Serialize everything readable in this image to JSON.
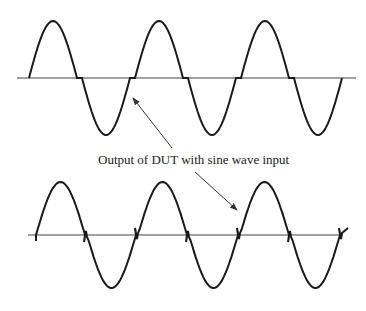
{
  "diagram": {
    "annotation": "Output of DUT with sine wave input",
    "top_waveform": {
      "name": "sine output with crossover dead-zone (flat segments at zero crossing)",
      "axis": {
        "y": 78,
        "x_start": 17,
        "x_end": 356
      },
      "period_px": 106,
      "amplitude_px": 57,
      "dead_zone_px": 5,
      "start_x": 29,
      "cycles": 3
    },
    "bottom_waveform": {
      "name": "sine output with zero-crossing glitches (small spikes at crossings)",
      "axis": {
        "y": 235,
        "x_start": 28,
        "x_end": 343
      },
      "period_px": 98,
      "amplitude_px": 53,
      "start_x": 36,
      "cycles": 3.2
    },
    "colors": {
      "stroke": "#1a1a1a",
      "axis": "#444444",
      "arrow": "#333333",
      "background": "#ffffff"
    }
  }
}
